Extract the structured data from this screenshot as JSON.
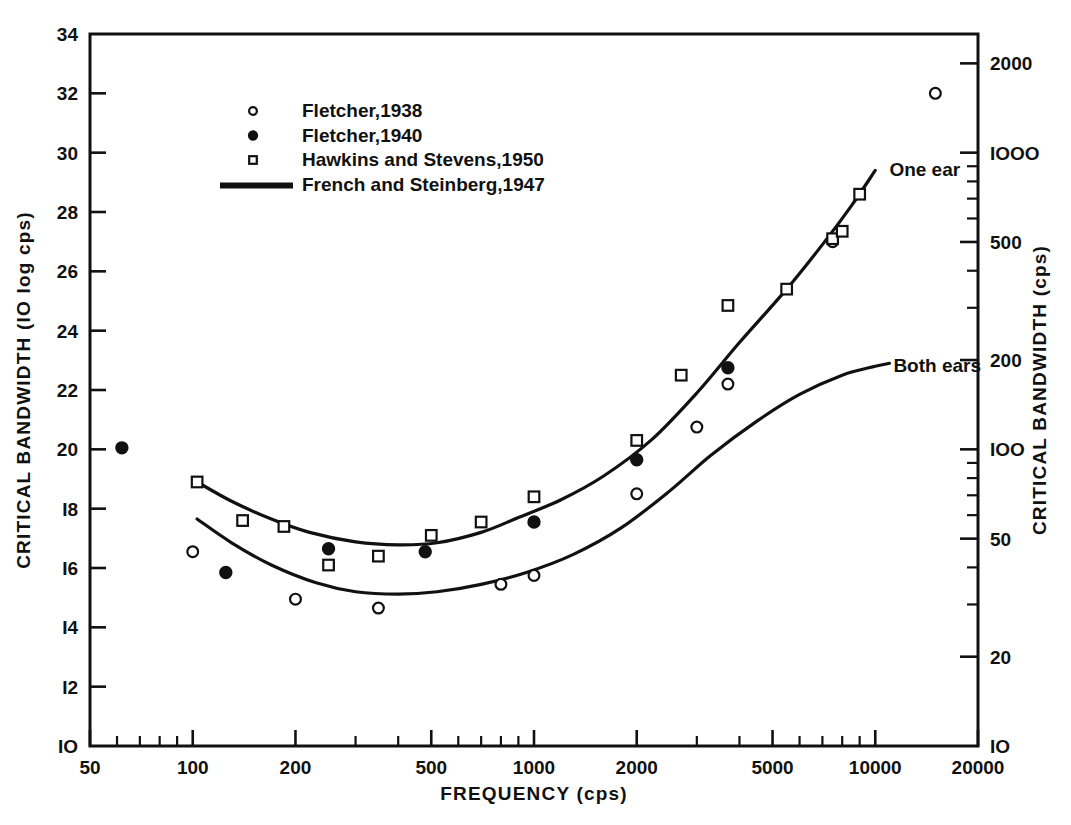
{
  "figure": {
    "background": "#ffffff",
    "ink": "#111111"
  },
  "chart_data": {
    "type": "scatter",
    "title": "",
    "xlabel": "FREQUENCY (cps)",
    "ylabel": "CRITICAL BANDWIDTH (IO log cps)",
    "y2label": "CRITICAL BANDWIDTH (cps)",
    "xscale": "log",
    "yscale": "linear",
    "y2scale": "log",
    "xlim": [
      50,
      20000
    ],
    "ylim": [
      10,
      34
    ],
    "y2lim": [
      10,
      2511
    ],
    "grid": false,
    "legend_position": "upper-left-inside",
    "xticks_major": [
      50,
      100,
      200,
      500,
      1000,
      2000,
      5000,
      10000,
      20000
    ],
    "xtick_labels": [
      "50",
      "100",
      "200",
      "500",
      "1000",
      "2000",
      "5000",
      "10000",
      "20000"
    ],
    "xticks_minor": [
      60,
      70,
      80,
      90,
      300,
      400,
      600,
      700,
      800,
      900,
      3000,
      4000,
      6000,
      7000,
      8000,
      9000
    ],
    "yticks_major": [
      10,
      12,
      14,
      16,
      18,
      20,
      22,
      24,
      26,
      28,
      30,
      32,
      34
    ],
    "ytick_labels": [
      "IO",
      "I2",
      "I4",
      "I6",
      "I8",
      "20",
      "22",
      "24",
      "26",
      "28",
      "30",
      "32",
      "34"
    ],
    "y2ticks_major": [
      10,
      20,
      50,
      100,
      200,
      500,
      1000,
      2000
    ],
    "y2tick_labels": [
      "IO",
      "20",
      "50",
      "IOO",
      "200",
      "500",
      "IOOO",
      "2000"
    ],
    "y2ticks_minor": [
      30,
      40,
      60,
      70,
      80,
      90,
      300,
      400,
      600,
      700,
      800,
      900
    ],
    "legend": [
      {
        "label": "Fletcher,1938",
        "marker": "open-circle"
      },
      {
        "label": "Fletcher,1940",
        "marker": "filled-circle"
      },
      {
        "label": "Hawkins and Stevens,1950",
        "marker": "open-square"
      },
      {
        "label": "French and Steinberg,1947",
        "marker": "line"
      }
    ],
    "curve_labels": [
      {
        "text": "One ear",
        "x": 11000,
        "y": 29.2
      },
      {
        "text": "Both ears",
        "x": 11300,
        "y": 22.6
      }
    ],
    "series": [
      {
        "name": "Fletcher,1938",
        "marker": "open-circle",
        "points": [
          [
            100,
            16.55
          ],
          [
            200,
            14.95
          ],
          [
            350,
            14.65
          ],
          [
            800,
            15.45
          ],
          [
            1000,
            15.75
          ],
          [
            2000,
            18.5
          ],
          [
            3000,
            20.75
          ],
          [
            3700,
            22.2
          ],
          [
            7500,
            27.0
          ],
          [
            15000,
            32.0
          ]
        ]
      },
      {
        "name": "Fletcher,1940",
        "marker": "filled-circle",
        "points": [
          [
            62,
            20.05
          ],
          [
            125,
            15.85
          ],
          [
            250,
            16.65
          ],
          [
            480,
            16.55
          ],
          [
            1000,
            17.55
          ],
          [
            2000,
            19.65
          ],
          [
            3700,
            22.75
          ]
        ]
      },
      {
        "name": "Hawkins and Stevens,1950",
        "marker": "open-square",
        "points": [
          [
            103,
            18.9
          ],
          [
            140,
            17.6
          ],
          [
            185,
            17.4
          ],
          [
            250,
            16.1
          ],
          [
            350,
            16.4
          ],
          [
            500,
            17.1
          ],
          [
            700,
            17.55
          ],
          [
            1000,
            18.4
          ],
          [
            2000,
            20.3
          ],
          [
            2700,
            22.5
          ],
          [
            3700,
            24.85
          ],
          [
            5500,
            25.4
          ],
          [
            7500,
            27.1
          ],
          [
            8000,
            27.35
          ],
          [
            9000,
            28.6
          ]
        ]
      }
    ],
    "curves": [
      {
        "name": "One ear",
        "description": "French and Steinberg,1947 one-ear critical bandwidth curve",
        "points": [
          [
            103,
            18.9
          ],
          [
            130,
            18.25
          ],
          [
            170,
            17.65
          ],
          [
            220,
            17.2
          ],
          [
            300,
            16.88
          ],
          [
            400,
            16.78
          ],
          [
            520,
            16.85
          ],
          [
            700,
            17.2
          ],
          [
            900,
            17.7
          ],
          [
            1200,
            18.3
          ],
          [
            1600,
            19.1
          ],
          [
            2200,
            20.3
          ],
          [
            3000,
            21.9
          ],
          [
            4000,
            23.6
          ],
          [
            5500,
            25.4
          ],
          [
            7000,
            26.9
          ],
          [
            8500,
            28.2
          ],
          [
            10000,
            29.4
          ]
        ]
      },
      {
        "name": "Both ears",
        "description": "French and Steinberg,1947 both-ears critical bandwidth curve",
        "points": [
          [
            103,
            17.65
          ],
          [
            130,
            16.85
          ],
          [
            170,
            16.1
          ],
          [
            230,
            15.5
          ],
          [
            300,
            15.2
          ],
          [
            400,
            15.12
          ],
          [
            520,
            15.2
          ],
          [
            700,
            15.45
          ],
          [
            950,
            15.85
          ],
          [
            1300,
            16.45
          ],
          [
            1800,
            17.35
          ],
          [
            2500,
            18.6
          ],
          [
            3300,
            19.8
          ],
          [
            4500,
            20.95
          ],
          [
            6000,
            21.85
          ],
          [
            8000,
            22.5
          ],
          [
            10000,
            22.8
          ],
          [
            11000,
            22.9
          ]
        ]
      }
    ]
  }
}
